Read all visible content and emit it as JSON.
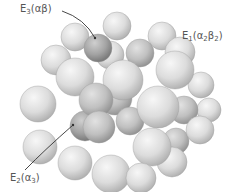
{
  "diagram": {
    "title": "",
    "colors": {
      "background": "#ffffff",
      "sphere_light": "#e6e6e6",
      "sphere_mid": "#c4c4c4",
      "sphere_dark": "#8e8e8e",
      "highlight_sphere_dark": "#6f6f6f",
      "label_text": "#555555",
      "leader_line": "#333333"
    },
    "labels": [
      {
        "id": "E3",
        "base": "E",
        "sub": "3",
        "text_open": "(",
        "greek": "αβ",
        "greek_sub": "",
        "text_close": ")",
        "full": "E3(αβ)",
        "x": 20,
        "y": 3
      },
      {
        "id": "E1",
        "base": "E",
        "sub": "1",
        "text_open": "(",
        "greek": "α",
        "greek_sub": "2",
        "greek2": "β",
        "greek2_sub": "2",
        "text_close": ")",
        "full": "E1(α2β2)",
        "x": 182,
        "y": 30
      },
      {
        "id": "E2",
        "base": "E",
        "sub": "2",
        "text_open": "(",
        "greek": "α",
        "greek_sub": "3",
        "text_close": ")",
        "full": "E2(α3)",
        "x": 10,
        "y": 172
      }
    ],
    "spheres": [
      {
        "x": 75,
        "y": 37,
        "r": 14,
        "tone": "light"
      },
      {
        "x": 117,
        "y": 26,
        "r": 14,
        "tone": "light"
      },
      {
        "x": 162,
        "y": 36,
        "r": 14,
        "tone": "light"
      },
      {
        "x": 201,
        "y": 85,
        "r": 13,
        "tone": "light"
      },
      {
        "x": 209,
        "y": 110,
        "r": 12,
        "tone": "light"
      },
      {
        "x": 110,
        "y": 55,
        "r": 14,
        "tone": "light"
      },
      {
        "x": 140,
        "y": 53,
        "r": 14,
        "tone": "mid"
      },
      {
        "x": 56,
        "y": 60,
        "r": 15,
        "tone": "light"
      },
      {
        "x": 98,
        "y": 48,
        "r": 14,
        "tone": "dark"
      },
      {
        "x": 180,
        "y": 52,
        "r": 15,
        "tone": "light"
      },
      {
        "x": 38,
        "y": 104,
        "r": 18,
        "tone": "light"
      },
      {
        "x": 40,
        "y": 147,
        "r": 17,
        "tone": "light"
      },
      {
        "x": 184,
        "y": 110,
        "r": 14,
        "tone": "mid"
      },
      {
        "x": 176,
        "y": 141,
        "r": 13,
        "tone": "mid"
      },
      {
        "x": 200,
        "y": 130,
        "r": 14,
        "tone": "light"
      },
      {
        "x": 115,
        "y": 98,
        "r": 17,
        "tone": "mid"
      },
      {
        "x": 85,
        "y": 126,
        "r": 15,
        "tone": "dark"
      },
      {
        "x": 130,
        "y": 121,
        "r": 14,
        "tone": "mid"
      },
      {
        "x": 75,
        "y": 77,
        "r": 19,
        "tone": "light"
      },
      {
        "x": 175,
        "y": 70,
        "r": 19,
        "tone": "light"
      },
      {
        "x": 123,
        "y": 80,
        "r": 20,
        "tone": "light"
      },
      {
        "x": 96,
        "y": 100,
        "r": 17,
        "tone": "mid"
      },
      {
        "x": 99,
        "y": 127,
        "r": 16,
        "tone": "mid"
      },
      {
        "x": 158,
        "y": 107,
        "r": 21,
        "tone": "light"
      },
      {
        "x": 75,
        "y": 163,
        "r": 17,
        "tone": "light"
      },
      {
        "x": 111,
        "y": 174,
        "r": 19,
        "tone": "light"
      },
      {
        "x": 172,
        "y": 162,
        "r": 15,
        "tone": "light"
      },
      {
        "x": 152,
        "y": 147,
        "r": 19,
        "tone": "light"
      },
      {
        "x": 141,
        "y": 178,
        "r": 15,
        "tone": "light"
      }
    ],
    "leaders": [
      {
        "from": [
          62,
          11
        ],
        "to": [
          95,
          38
        ],
        "target": "E3"
      },
      {
        "from": [
          25,
          170
        ],
        "to": [
          73,
          125
        ],
        "target": "E2"
      }
    ]
  }
}
